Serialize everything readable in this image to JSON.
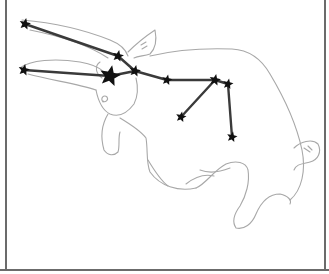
{
  "figure": {
    "outline": "bull",
    "colors": {
      "background": "#ffffff",
      "outline": "#a8a8a8",
      "constellation_line": "#3a3a3a",
      "star": "#111111",
      "frame": "#6b6b6b"
    },
    "stars": [
      {
        "x": 25,
        "y": 24,
        "size": 6
      },
      {
        "x": 118,
        "y": 56,
        "size": 6
      },
      {
        "x": 135,
        "y": 71,
        "size": 6
      },
      {
        "x": 24,
        "y": 70,
        "size": 6
      },
      {
        "x": 110,
        "y": 76,
        "size": 11
      },
      {
        "x": 167,
        "y": 80,
        "size": 5.5
      },
      {
        "x": 215,
        "y": 80,
        "size": 6
      },
      {
        "x": 228,
        "y": 84,
        "size": 5.5
      },
      {
        "x": 181,
        "y": 117,
        "size": 5.5
      },
      {
        "x": 232,
        "y": 137,
        "size": 5.5
      }
    ],
    "lines": [
      [
        0,
        1
      ],
      [
        1,
        2
      ],
      [
        2,
        5
      ],
      [
        5,
        6
      ],
      [
        6,
        7
      ],
      [
        7,
        9
      ],
      [
        3,
        4
      ],
      [
        4,
        2
      ],
      [
        6,
        8
      ]
    ]
  }
}
